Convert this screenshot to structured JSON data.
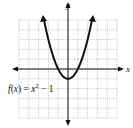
{
  "chart_data": {
    "type": "line",
    "title": "",
    "function_label": "f(x) = x² − 1",
    "xlabel": "x",
    "ylabel": "y",
    "xlim": [
      -5,
      5
    ],
    "ylim": [
      -5,
      5
    ],
    "grid": true,
    "grid_style": "dotted",
    "series": [
      {
        "name": "f(x) = x^2 - 1",
        "x": [
          -2.45,
          -2,
          -1.5,
          -1,
          -0.5,
          0,
          0.5,
          1,
          1.5,
          2,
          2.45
        ],
        "y": [
          5,
          3,
          1.25,
          0,
          -0.75,
          -1,
          -0.75,
          0,
          1.25,
          3,
          5
        ]
      }
    ]
  },
  "labels": {
    "x_axis": "x",
    "y_axis": "y",
    "function": "f(x) = x² − 1"
  }
}
